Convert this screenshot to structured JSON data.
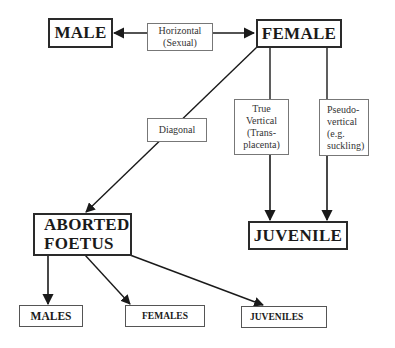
{
  "diagram": {
    "type": "transmission-flow",
    "nodes": {
      "male": "MALE",
      "female": "FEMALE",
      "aborted_foetus_line1": "ABORTED",
      "aborted_foetus_line2": "FOETUS",
      "juvenile": "JUVENILE",
      "males": "MALES",
      "females": "FEMALES",
      "juveniles": "JUVENILES"
    },
    "edge_labels": {
      "horizontal_line1": "Horizontal",
      "horizontal_line2": "(Sexual)",
      "diagonal": "Diagonal",
      "true_vertical_line1": "True",
      "true_vertical_line2": "Vertical",
      "true_vertical_line3": "(Trans-",
      "true_vertical_line4": "placenta)",
      "pseudo_vertical_line1": "Pseudo-",
      "pseudo_vertical_line2": "vertical",
      "pseudo_vertical_line3": "(e.g.",
      "pseudo_vertical_line4": "suckling)"
    },
    "edges": [
      {
        "from": "FEMALE",
        "to": "MALE",
        "label": "Horizontal (Sexual)",
        "bidirectional": true
      },
      {
        "from": "FEMALE",
        "to": "ABORTED FOETUS",
        "label": "Diagonal"
      },
      {
        "from": "FEMALE",
        "to": "JUVENILE",
        "label": "True Vertical (Trans-placenta)"
      },
      {
        "from": "FEMALE",
        "to": "JUVENILE",
        "label": "Pseudo-vertical (e.g. suckling)"
      },
      {
        "from": "ABORTED FOETUS",
        "to": "MALES"
      },
      {
        "from": "ABORTED FOETUS",
        "to": "FEMALES"
      },
      {
        "from": "ABORTED FOETUS",
        "to": "JUVENILES"
      }
    ]
  }
}
